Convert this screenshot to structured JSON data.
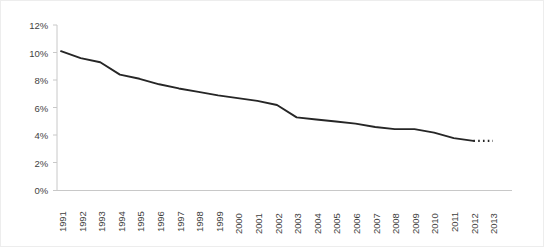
{
  "chart_data": {
    "type": "line",
    "title": "",
    "subtitle": "",
    "xlabel": "",
    "ylabel": "",
    "grid": false,
    "legend": null,
    "xlim": [
      1991,
      2013
    ],
    "ylim": [
      0,
      12
    ],
    "ytick_labels": [
      "0%",
      "2%",
      "4%",
      "6%",
      "8%",
      "10%",
      "12%"
    ],
    "ytick_values": [
      0,
      2,
      4,
      6,
      8,
      10,
      12
    ],
    "xtick_labels": [
      "1991",
      "1992",
      "1993",
      "1994",
      "1995",
      "1996",
      "1997",
      "1998",
      "1999",
      "2000",
      "2001",
      "2002",
      "2003",
      "2004",
      "2005",
      "2006",
      "2007",
      "2008",
      "2009",
      "2010",
      "2011",
      "2012",
      "2013"
    ],
    "x": [
      1991,
      1992,
      1993,
      1994,
      1995,
      1996,
      1997,
      1998,
      1999,
      2000,
      2001,
      2002,
      2003,
      2004,
      2005,
      2006,
      2007,
      2008,
      2009,
      2010,
      2011,
      2012,
      2013
    ],
    "series": [
      {
        "name": "actual",
        "style": "solid",
        "color": "#262626",
        "x": [
          1991,
          1992,
          1993,
          1994,
          1995,
          1996,
          1997,
          1998,
          1999,
          2000,
          2001,
          2002,
          2003,
          2004,
          2005,
          2006,
          2007,
          2008,
          2009,
          2010,
          2011,
          2012
        ],
        "values": [
          10.1,
          9.6,
          9.3,
          8.4,
          8.1,
          7.7,
          7.4,
          7.15,
          6.9,
          6.7,
          6.5,
          6.2,
          5.3,
          5.15,
          5.0,
          4.85,
          4.6,
          4.45,
          4.45,
          4.2,
          3.8,
          3.6
        ]
      },
      {
        "name": "forecast",
        "style": "dotted",
        "color": "#262626",
        "x": [
          2012,
          2013
        ],
        "values": [
          3.6,
          3.6
        ]
      }
    ]
  },
  "axes": {
    "y_axis_name": "percent-axis",
    "x_axis_name": "year-axis"
  }
}
